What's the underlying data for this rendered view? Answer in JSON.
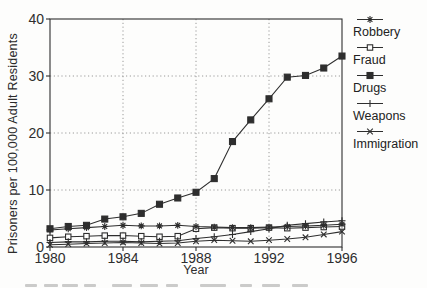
{
  "figure": {
    "bg": "#fdfdfc",
    "ink": "#2e2e2e",
    "grid_color": "#8f8f8f"
  },
  "chart_data": {
    "type": "line",
    "title": "",
    "xlabel": "Year",
    "ylabel": "Prisoners per 100,000 Adult Residents",
    "xlim": [
      1980,
      1996
    ],
    "ylim": [
      0,
      40
    ],
    "xticks": [
      1980,
      1984,
      1988,
      1992,
      1996
    ],
    "yticks": [
      0,
      10,
      20,
      30,
      40
    ],
    "grid": {
      "vertical_at": [
        1984,
        1988,
        1992
      ],
      "horizontal_at": [
        10,
        20,
        30
      ],
      "style": "dotted"
    },
    "legend_position": "right",
    "x": [
      1980,
      1981,
      1982,
      1983,
      1984,
      1985,
      1986,
      1987,
      1988,
      1989,
      1990,
      1991,
      1992,
      1993,
      1994,
      1995,
      1996
    ],
    "series": [
      {
        "name": "Robbery",
        "marker": "asterisk",
        "values": [
          3.0,
          3.2,
          3.4,
          3.6,
          3.8,
          3.7,
          3.7,
          3.8,
          3.6,
          3.5,
          3.4,
          3.4,
          3.5,
          3.6,
          3.7,
          3.8,
          4.0
        ]
      },
      {
        "name": "Fraud",
        "marker": "open-square",
        "values": [
          1.6,
          1.8,
          1.9,
          2.0,
          2.0,
          1.9,
          1.8,
          1.9,
          3.2,
          3.4,
          3.3,
          3.3,
          3.4,
          3.3,
          3.4,
          3.5,
          3.6
        ]
      },
      {
        "name": "Drugs",
        "marker": "filled-square",
        "values": [
          3.2,
          3.6,
          3.8,
          4.9,
          5.3,
          5.9,
          7.5,
          8.6,
          9.6,
          12.0,
          18.5,
          22.3,
          26.0,
          29.8,
          30.1,
          31.4,
          33.5
        ]
      },
      {
        "name": "Weapons",
        "marker": "plus",
        "values": [
          0.8,
          0.9,
          0.9,
          1.0,
          1.0,
          0.9,
          1.0,
          1.1,
          1.5,
          1.8,
          2.2,
          2.7,
          3.2,
          3.8,
          4.1,
          4.4,
          4.6
        ]
      },
      {
        "name": "Immigration",
        "marker": "x",
        "values": [
          0.4,
          0.5,
          0.6,
          0.7,
          0.8,
          0.7,
          0.6,
          0.7,
          1.0,
          1.2,
          1.1,
          1.0,
          1.2,
          1.4,
          1.7,
          2.2,
          2.7
        ]
      }
    ]
  }
}
